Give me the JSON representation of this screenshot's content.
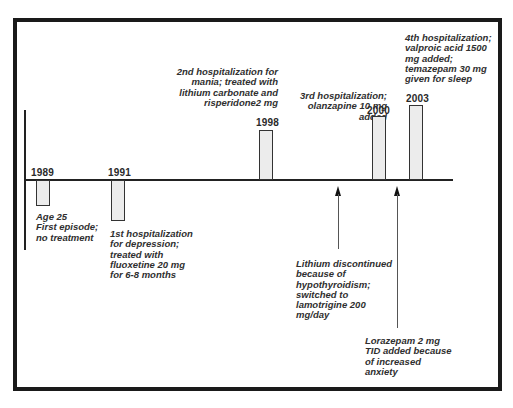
{
  "timeline": {
    "events": [
      {
        "year": "1989",
        "direction": "below",
        "description": "Age 25\nFirst episode;\nno treatment"
      },
      {
        "year": "1991",
        "direction": "below",
        "description": "1st hospitalization\nfor depression;\ntreated with\nfluoxetine 20 mg\nfor 6-8 months"
      },
      {
        "year": "1998",
        "direction": "above",
        "description": "2nd hospitalization for\nmania; treated with\nlithium carbonate and\nrisperidone2 mg"
      },
      {
        "year": "2000",
        "direction": "above",
        "description": "3rd hospitalization;\nolanzapine 10 mg\nadded"
      },
      {
        "year": "2003",
        "direction": "above",
        "description": "4th hospitalization;\nvalproic acid 1500\nmg added;\ntemazepam 30 mg\ngiven for sleep"
      }
    ],
    "arrows": [
      {
        "label": "Lithium discontinued\nbecause of\nhypothyroidism;\nswitched to\nlamotrigine 200\nmg/day"
      },
      {
        "label": "Lorazepam 2 mg\nTID added because\nof increased\nanxiety"
      }
    ]
  },
  "colors": {
    "frame": "#1a1a1a",
    "bar_fill": "#ececec",
    "bar_stroke": "#333333",
    "text": "#2f2f2f"
  }
}
